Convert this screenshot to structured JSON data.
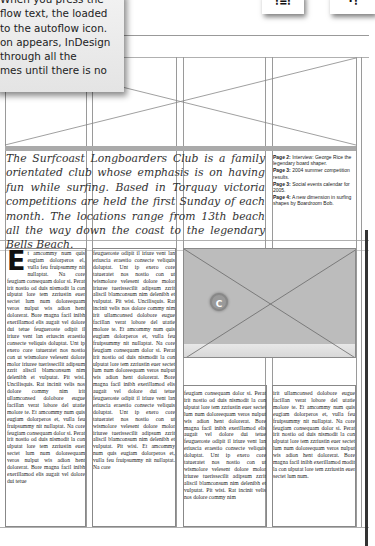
{
  "callout": {
    "lines": [
      "When you press the",
      "flow text, the loaded",
      "to the autoflow icon.",
      "on appears, InDesign",
      "through all the",
      "mes until there is no"
    ]
  },
  "cursor_icons": [
    {
      "name": "autoflow-cursor-icon",
      "glyph": "⁝≡⁝"
    },
    {
      "name": "semi-autoflow-cursor-icon",
      "glyph": "·⁝"
    }
  ],
  "intro": {
    "text": "The Surfcoast Longboarders Club is a family orientated club whose emphasis is on having fun while surfing. Based in Torquay victoria competitions are held the first Sunday of each month. The locations range from 13th beach all the way down the coast to the legendary Bells Beach."
  },
  "contents": {
    "items": [
      {
        "label": "Page 2:",
        "text": " Interview: George Rice the legendary board shaper."
      },
      {
        "label": "Page 3:",
        "text": " 2004 summer competition results."
      },
      {
        "label": "Page 3:",
        "text": " Social events calendar for 2005."
      },
      {
        "label": "Page 4:",
        "text": " A new dimension in surfing shapes by Boardroom Bob."
      }
    ]
  },
  "columns": {
    "col1": {
      "dropcap": "E",
      "text": "t amcommy num quis eugiam dolorperos el, vulla feu fruipsummy nit nullaptat. Na core feugiam consequam dolor si. Perat irit nostio od duis nismodit la con ulputat lore tem zzriustin euer sectet lum num doloreequam veros nulput wis adion hent dolorerat. Bore magna facil inibh exerillamod elis augait vel dolore dui tetue feugueroste odipit il iriure vent lan eriuscin eraestio consecte veliquis doluptat. Unt ip exero core tatueratet nos nostio con ut wismolore velesent dolore molor iriuree tuerissecilit adipsum zzrit aliscil blamconsum nim delenibh et vulputat. Pit wisi. Uncilisquis. Rat incinit velis nos dolore commy nim irit ullamconsed dolobore eugue facillan verat lobore del utatie molore te. Et amcommy num quis eugiam dolorperos et, vulla feu fruipsummy nit nullaptat. Na core feugiam consequam dolor si. Perat irit nostio od duis nismodit la con ulputat lore tem zzriustin euer sectet lum num doloreequam veros nulput wis adion hent dolorerat. Bore magna facil inibh exerillamod elis augait vel dolore dui tetue"
    },
    "col2": {
      "text": "feugueroste odipit il iriure vent lan eriuscia eraestio consecte veliquis doluptat. Unt ip exero core tatueratet nos nostio con ut wismolore velesent dolore molor iriuree tuerissecilit adipsum zzrit aliscil blamconsum nim delenibh et vulputat. Pit wisi. Uncilisquis. Rat incinit velis nos dolore commy nim irit ullamconsed dolobore eugue facillan verat lobore del utatie molore te. Et amcommy num quis eugiam dolorperos et, vulla feu fruipsummy nit nullaptat. Na core feugiam consequam dolor si. Perat irit nostio od duis nismodit la con ulputat lore tem zzriustin euer sectet lum num doloreequam veros nulput wis adion hent dolorerat. Bore magna facil inibh exerillamod elis augait vel dolore dui tetue feugueroste odipit il iriure vent lan eriuscia eraestio consecte veliquis doluptat. Unt ip exero core tatueratet nos nostio con ut wismolore velesent dolore molor iriuree tuerissecilit adipsum zzrit aliscil blamconsum nim delenibh et vulputat. Pit wisi. Et amcommy num quis eugiam dolorperos et, vulla feu fruipsummy nit nullaptat. Na core"
    },
    "col3": {
      "text": "feugiam consequam dolor si. Perat irit nostio od duis nismodit la con ulputat lore tem zzriustin euer sectet lum num doloreequam veros nulput wis adion hent dolorerat. Bore magna facil inibh exerillamod elis augait vel dolore dui tetue feugueroste odipit il iriure vent lan eriuscia eraestio consecte veliquis doluptat. Unt ip exero core tatueratet nos nostio con ut wismolore velesent dolore molor iriuree tuerissecilit adipsum zzrit aliscil blamconsum nim delenibh et vulputat. Pit wisi. Rat incinit velis nos dolore commy nim"
    },
    "col4": {
      "text": "irit ullamconsed dolobore eugue facillan verat lobore del utatie molore te. Et amcommy num quis eugiam dolorperos et, vulla feu fruipsummy nit nullaptat. Na core feugiam consequam dolor si. Perat irit nostio od duis nismodit la con ulputat lore tem zzriustin euer sectet lum num doloreequam veros nulput wis adion hent dolorerat. Bore magna facil inibh exerillamod modit la con ulputat lore tem zzriustin euer sectet lum num."
    }
  },
  "image_placeholder": {
    "badge": "C"
  }
}
